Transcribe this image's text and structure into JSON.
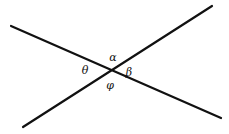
{
  "figure": {
    "type": "geometry-diagram",
    "width": 229,
    "height": 134,
    "background_color": "#ffffff",
    "line_color": "#111111",
    "line_width": 2.2,
    "intersection": {
      "x": 111,
      "y": 71
    },
    "lines": [
      {
        "name": "line-down-right",
        "x1": 11,
        "y1": 26,
        "x2": 221,
        "y2": 118
      },
      {
        "name": "line-up-right",
        "x1": 23,
        "y1": 127,
        "x2": 212,
        "y2": 6
      }
    ],
    "labels": [
      {
        "name": "angle-alpha",
        "text": "α",
        "x": 113,
        "y": 57,
        "position": "top"
      },
      {
        "name": "angle-theta",
        "text": "θ",
        "x": 85,
        "y": 70,
        "position": "left"
      },
      {
        "name": "angle-beta",
        "text": "β",
        "x": 129,
        "y": 72,
        "position": "right"
      },
      {
        "name": "angle-phi",
        "text": "φ",
        "x": 110,
        "y": 85,
        "position": "bottom"
      }
    ]
  }
}
